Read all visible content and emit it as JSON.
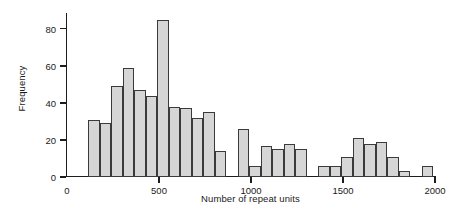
{
  "chart_data": {
    "type": "bar",
    "title": "",
    "subtitle": "",
    "xlabel": "Number of repeat units",
    "ylabel": "Frequency",
    "grid": false,
    "legend": null,
    "xlim": [
      0,
      2000
    ],
    "ylim": [
      0,
      88
    ],
    "xticks": [
      0,
      500,
      1000,
      1500,
      2000
    ],
    "xticklabels": [
      "0",
      "500",
      "1000",
      "1500",
      "2000"
    ],
    "yticks": [
      0,
      20,
      40,
      60,
      80
    ],
    "yticklabels": [
      "0",
      "20",
      "40",
      "60",
      "80"
    ],
    "bin_width": 62.5,
    "bin_starts": [
      115,
      177.5,
      240,
      302.5,
      365,
      427.5,
      490,
      552.5,
      615,
      677.5,
      740,
      865,
      927.5,
      990,
      1052.5,
      1115,
      1177.5,
      1240,
      1302.5,
      1365,
      1427.5,
      1490,
      1552.5,
      1677.5,
      1802.5,
      1865
    ],
    "values": [
      31,
      29,
      49,
      59,
      47,
      44,
      85,
      38,
      37,
      32,
      35,
      14,
      26,
      6,
      17,
      15,
      18,
      15,
      6,
      6,
      11,
      21,
      18,
      19,
      11,
      3,
      6,
      5,
      7
    ],
    "bars": [
      {
        "x0": 115,
        "x1": 177.5,
        "value": 31
      },
      {
        "x0": 177.5,
        "x1": 240,
        "value": 29
      },
      {
        "x0": 240,
        "x1": 302.5,
        "value": 49
      },
      {
        "x0": 302.5,
        "x1": 365,
        "value": 59
      },
      {
        "x0": 365,
        "x1": 427.5,
        "value": 47
      },
      {
        "x0": 427.5,
        "x1": 490,
        "value": 44
      },
      {
        "x0": 490,
        "x1": 552.5,
        "value": 85
      },
      {
        "x0": 552.5,
        "x1": 615,
        "value": 38
      },
      {
        "x0": 615,
        "x1": 677.5,
        "value": 37
      },
      {
        "x0": 677.5,
        "x1": 740,
        "value": 32
      },
      {
        "x0": 740,
        "x1": 802.5,
        "value": 35
      },
      {
        "x0": 802.5,
        "x1": 865,
        "value": 14
      },
      {
        "x0": 927.5,
        "x1": 990,
        "value": 26
      },
      {
        "x0": 990,
        "x1": 1052.5,
        "value": 6
      },
      {
        "x0": 1052.5,
        "x1": 1115,
        "value": 17
      },
      {
        "x0": 1115,
        "x1": 1177.5,
        "value": 15
      },
      {
        "x0": 1177.5,
        "x1": 1240,
        "value": 18
      },
      {
        "x0": 1240,
        "x1": 1302.5,
        "value": 15
      },
      {
        "x0": 1365,
        "x1": 1427.5,
        "value": 6
      },
      {
        "x0": 1427.5,
        "x1": 1490,
        "value": 6
      },
      {
        "x0": 1490,
        "x1": 1552.5,
        "value": 11
      },
      {
        "x0": 1552.5,
        "x1": 1615,
        "value": 21
      },
      {
        "x0": 1615,
        "x1": 1677.5,
        "value": 18
      },
      {
        "x0": 1677.5,
        "x1": 1740,
        "value": 19
      },
      {
        "x0": 1740,
        "x1": 1802.5,
        "value": 11
      },
      {
        "x0": 1802.5,
        "x1": 1865,
        "value": 3
      },
      {
        "x0": 1927.5,
        "x1": 1990,
        "value": 6
      },
      {
        "x0": 2052.5,
        "x1": 2115,
        "value": 5
      },
      {
        "x0": 2115,
        "x1": 2177.5,
        "value": 7
      }
    ],
    "colors": {
      "bar_fill": "#d6d6d6",
      "bar_edge": "#3a3a3a",
      "axis": "#1d1d1d",
      "text": "#1a1a1a",
      "background": "#ffffff"
    }
  }
}
